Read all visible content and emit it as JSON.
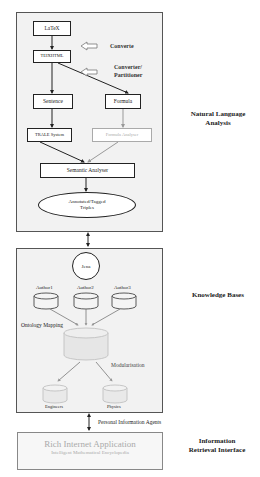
{
  "diagram": {
    "nla": {
      "latex": "LaTeX",
      "texhtml": "TEIXHTML",
      "converte": "Converte",
      "converter1": "Converter/",
      "converter2": "Partitioner",
      "sentence": "Sentence",
      "formula": "Formula",
      "trale": "TRALE System",
      "formula_analyser": "Formula Analyser",
      "semantic": "Semantic Analyser",
      "triples1": "Annotated/Tagged",
      "triples2": "Triples"
    },
    "kb": {
      "jena": "Jena",
      "authors": [
        "Author1",
        "Author2",
        "Author3"
      ],
      "ontology_mapping": "Ontology Mapping",
      "modularisation": "Modularisation",
      "outputs": [
        "Engineers",
        "Physics"
      ]
    },
    "link_label": "Personal Information Agents",
    "ria": {
      "title": "Rich Internet Application",
      "subtitle": "Intelligent Mathematical Encyclopedia"
    },
    "side_labels": {
      "nla1": "Natural Language",
      "nla2": "Analysis",
      "kb": "Knowledge Bases",
      "iri1": "Information",
      "iri2": "Retrieval Interface"
    }
  }
}
